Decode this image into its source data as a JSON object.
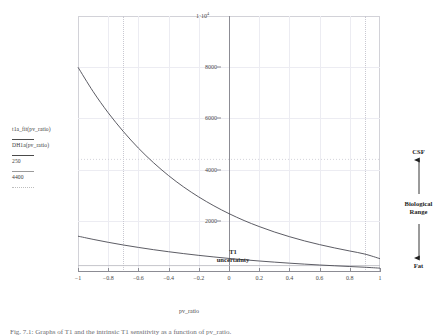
{
  "chart_data": {
    "type": "line",
    "title": "",
    "xlabel": "pv_ratio",
    "ylabel": "",
    "xlim": [
      -1,
      1
    ],
    "ylim": [
      0,
      10000
    ],
    "grid": true,
    "legend_position": "left-outside",
    "x_ticks": [
      "−1",
      "−0.8",
      "−0.6",
      "−0.4",
      "−0.2",
      "0",
      "0.2",
      "0.4",
      "0.6",
      "0.8",
      "1"
    ],
    "x_tick_values": [
      -1,
      -0.8,
      -0.6,
      -0.4,
      -0.2,
      0,
      0.2,
      0.4,
      0.6,
      0.8,
      1
    ],
    "y_ticks": [
      "2000",
      "4000",
      "6000",
      "8000"
    ],
    "y_tick_values": [
      2000,
      4000,
      6000,
      8000
    ],
    "y_top_label": "1·10",
    "y_top_exponent": "4",
    "y_top_value": 10000,
    "series": [
      {
        "name": "t1a_fit(pv_ratio)",
        "style": "solid-dark",
        "x": [
          -1.0,
          -0.9,
          -0.8,
          -0.7,
          -0.6,
          -0.5,
          -0.4,
          -0.3,
          -0.2,
          -0.1,
          0.0,
          0.1,
          0.2,
          0.3,
          0.4,
          0.5,
          0.6,
          0.7,
          0.8,
          0.9,
          1.0
        ],
        "values": [
          8000,
          7050,
          6220,
          5490,
          4840,
          4270,
          3765,
          3320,
          2930,
          2585,
          2280,
          2010,
          1775,
          1565,
          1380,
          1215,
          1070,
          940,
          820,
          700,
          520
        ]
      },
      {
        "name": "DH1a(pv_ratio)",
        "style": "solid-dark",
        "x": [
          -1.0,
          -0.9,
          -0.8,
          -0.7,
          -0.6,
          -0.5,
          -0.4,
          -0.3,
          -0.2,
          -0.1,
          0.0,
          0.1,
          0.2,
          0.3,
          0.4,
          0.5,
          0.6,
          0.7,
          0.8,
          0.9,
          1.0
        ],
        "values": [
          1400,
          1275,
          1160,
          1055,
          960,
          872,
          792,
          718,
          650,
          588,
          530,
          478,
          430,
          386,
          345,
          308,
          274,
          243,
          214,
          186,
          150
        ]
      },
      {
        "name": "250",
        "style": "thin-grey",
        "constant": 250
      },
      {
        "name": "4400",
        "style": "dotted-grey",
        "constant": 4400
      }
    ],
    "annotations": [
      {
        "name": "t1-uncertainty",
        "text_line1": "T1",
        "text_line2": "uncertainty",
        "x": -0.49,
        "y": 1500
      }
    ]
  },
  "legend": {
    "entries": [
      {
        "label": "t1a_fit(pv_ratio)",
        "style": "solid-dark"
      },
      {
        "label": "DH1a(pv_ratio)",
        "style": "solid-dark"
      },
      {
        "label": "250",
        "style": "thin-grey"
      },
      {
        "label": "4400",
        "style": "dotted-grey"
      }
    ]
  },
  "annotations": {
    "t1_line1": "T1",
    "t1_line2": "uncertainty"
  },
  "right_scale": {
    "top_label": "CSF",
    "middle_label_line1": "Biological",
    "middle_label_line2": "Range",
    "bottom_label": "Fat"
  },
  "axes": {
    "x_title": "pv_ratio"
  },
  "caption": {
    "text": "Fig. 7.1:  Graphs of T1 and the intrinsic T1 sensitivity as a function of pv_ratio."
  }
}
